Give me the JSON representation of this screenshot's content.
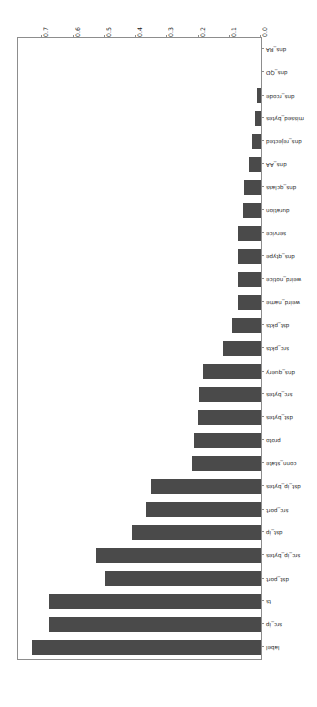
{
  "figure": {
    "rotation_degrees": 180,
    "background_color": "#ffffff",
    "bar_color": "#4a4a4a",
    "axis_color": "#8d8d8d"
  },
  "chart_data": {
    "type": "bar",
    "orientation": "horizontal",
    "title": "",
    "xlabel": "",
    "ylabel": "",
    "grid": false,
    "legend": null,
    "xlim": [
      0.0,
      0.7778
    ],
    "xticks": [
      "0.0",
      "0.1",
      "0.2",
      "0.3",
      "0.4",
      "0.5",
      "0.6",
      "0.7"
    ],
    "xtick_values": [
      0.0,
      0.1,
      0.2,
      0.3,
      0.4,
      0.5,
      0.6,
      0.7
    ],
    "categories": [
      "label",
      "src_ip",
      "ts",
      "dst_port",
      "src_ip_bytes",
      "dst_ip",
      "src_port",
      "dst_ip_bytes",
      "conn_state",
      "proto",
      "dst_bytes",
      "src_bytes",
      "dns_query",
      "src_pkts",
      "dst_pkts",
      "weird_name",
      "weird_notice",
      "dns_qtype",
      "service",
      "duration",
      "dns_qclass",
      "dns_AA",
      "dns_rejected",
      "missed_bytes",
      "dns_rcode",
      "dns_QD",
      "dns_RA"
    ],
    "values": [
      0.734,
      0.677,
      0.677,
      0.498,
      0.527,
      0.413,
      0.368,
      0.352,
      0.222,
      0.213,
      0.203,
      0.197,
      0.187,
      0.121,
      0.092,
      0.073,
      0.073,
      0.073,
      0.073,
      0.057,
      0.054,
      0.038,
      0.029,
      0.019,
      0.013,
      0.0,
      0.0
    ]
  }
}
